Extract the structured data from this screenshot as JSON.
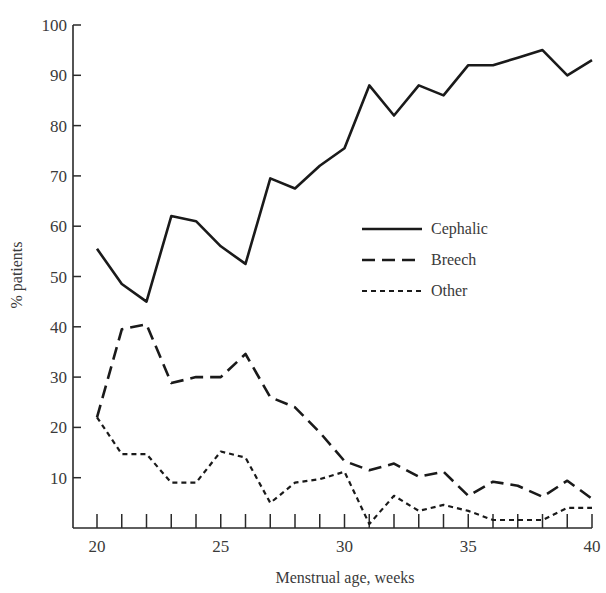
{
  "chart_data": {
    "type": "line",
    "title": "",
    "xlabel": "Menstrual age, weeks",
    "ylabel": "% patients",
    "xlim": [
      20,
      40
    ],
    "ylim": [
      0,
      100
    ],
    "grid": false,
    "legend_position": "center-right",
    "x": [
      20,
      21,
      22,
      23,
      24,
      25,
      26,
      27,
      28,
      29,
      30,
      31,
      32,
      33,
      34,
      35,
      36,
      37,
      38,
      39,
      40
    ],
    "x_ticks": [
      20,
      21,
      22,
      23,
      24,
      25,
      26,
      27,
      28,
      29,
      30,
      31,
      32,
      33,
      34,
      35,
      36,
      37,
      38,
      39,
      40
    ],
    "x_tick_labels": [
      "20",
      "25",
      "30",
      "35",
      "40"
    ],
    "y_ticks": [
      10,
      20,
      30,
      40,
      50,
      60,
      70,
      80,
      90,
      100
    ],
    "y_tick_labels": [
      "10",
      "20",
      "30",
      "40",
      "50",
      "60",
      "70",
      "80",
      "90",
      "100"
    ],
    "series": [
      {
        "name": "Cephalic",
        "style": "solid",
        "values": [
          55.5,
          48.5,
          45,
          62,
          61,
          56,
          52.5,
          69.5,
          67.5,
          72,
          75.5,
          88,
          82,
          88,
          86,
          92,
          92,
          93.5,
          95,
          90,
          93
        ]
      },
      {
        "name": "Breech",
        "style": "dashed",
        "values": [
          22,
          39.5,
          40.5,
          28.8,
          30,
          30,
          34.6,
          26,
          24,
          19,
          13.3,
          11.5,
          12.8,
          10.2,
          11.2,
          6.4,
          9.2,
          8.4,
          6.2,
          9.4,
          5.8
        ]
      },
      {
        "name": "Other",
        "style": "dotted",
        "values": [
          22,
          14.7,
          14.7,
          9,
          9,
          15.2,
          14,
          5,
          9,
          9.7,
          11.2,
          0.8,
          6.4,
          3.4,
          4.6,
          3.4,
          1.6,
          1.6,
          1.6,
          4,
          4
        ]
      }
    ]
  },
  "legend": {
    "items": [
      {
        "label": "Cephalic"
      },
      {
        "label": "Breech"
      },
      {
        "label": "Other"
      }
    ]
  },
  "colors": {
    "line": "#1a1a1a",
    "axis": "#2a2a2a",
    "text": "#3a3a3a"
  }
}
